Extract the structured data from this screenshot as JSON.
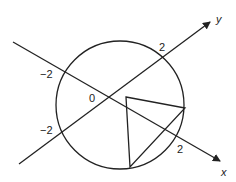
{
  "diagram": {
    "axes": {
      "x_label": "x",
      "y_label": "y",
      "origin_label": "0"
    },
    "ticks": {
      "x_pos": "2",
      "x_neg": "−2",
      "y_pos": "2",
      "y_neg": "−2"
    },
    "shapes": {
      "circle": "circle of radius 2 centered at origin",
      "triangle": "triangle inscribed with two vertices on circle"
    },
    "stroke_color": "#222222"
  }
}
